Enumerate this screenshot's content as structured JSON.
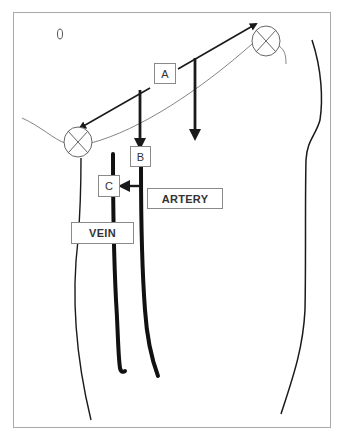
{
  "diagram": {
    "labels": {
      "a": "A",
      "b": "B",
      "c": "C",
      "artery": "ARTERY",
      "vein": "VEIN"
    },
    "icons": {
      "top_right_marker": "circle-x-icon",
      "left_marker": "circle-x-icon",
      "small_oval": "oval-mark-icon"
    },
    "colors": {
      "line": "#1a1a1a",
      "thin_line": "#777777",
      "frame": "#a8a8a8",
      "box_border": "#8a8a8a",
      "background": "#ffffff"
    }
  }
}
